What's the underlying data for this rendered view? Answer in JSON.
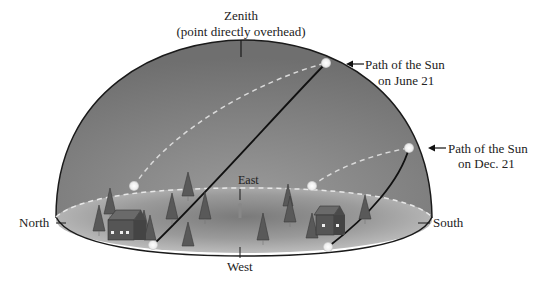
{
  "labels": {
    "zenith_title": "Zenith",
    "zenith_subtitle": "(point directly overhead)",
    "north": "North",
    "south": "South",
    "east": "East",
    "west": "West",
    "june_line1": "Path of the Sun",
    "june_line2": "on June 21",
    "dec_line1": "Path of the Sun",
    "dec_line2": "on Dec. 21"
  },
  "colors": {
    "dome": "#7d7d7d",
    "dome_edge": "#1a1a1a",
    "ground": "#a8a8a8",
    "sun": "#f4f4f4",
    "dashed_path": "#d8d8d8",
    "tree": "#555555",
    "house": "#5a5a5a"
  }
}
